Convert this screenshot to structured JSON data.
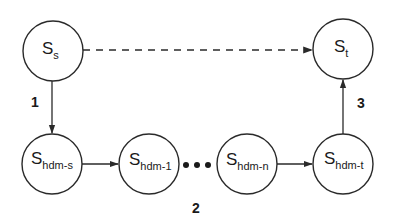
{
  "diagram": {
    "nodes": [
      {
        "id": "s_s",
        "main": "S",
        "sub": "s",
        "cx": 53,
        "cy": 51
      },
      {
        "id": "s_t",
        "main": "S",
        "sub": "t",
        "cx": 343,
        "cy": 49
      },
      {
        "id": "s_hdm_s",
        "main": "S",
        "sub": "hdm-s",
        "cx": 52,
        "cy": 164
      },
      {
        "id": "s_hdm_1",
        "main": "S",
        "sub": "hdm-1",
        "cx": 149,
        "cy": 164
      },
      {
        "id": "s_hdm_n",
        "main": "S",
        "sub": "hdm-n",
        "cx": 247,
        "cy": 164
      },
      {
        "id": "s_hdm_t",
        "main": "S",
        "sub": "hdm-t",
        "cx": 343,
        "cy": 164
      }
    ],
    "edges": [
      {
        "from": "s_s",
        "to": "s_t",
        "style": "dashed"
      },
      {
        "from": "s_s",
        "to": "s_hdm_s",
        "style": "solid",
        "label": "1"
      },
      {
        "from": "s_hdm_s",
        "to": "s_hdm_1",
        "style": "solid"
      },
      {
        "from": "s_hdm_1",
        "to": "s_hdm_n",
        "style": "ellipsis",
        "label": "2"
      },
      {
        "from": "s_hdm_n",
        "to": "s_hdm_t",
        "style": "solid"
      },
      {
        "from": "s_hdm_t",
        "to": "s_t",
        "style": "solid",
        "label": "3"
      }
    ],
    "labels": {
      "edge1": "1",
      "edge2": "2",
      "edge3": "3",
      "ellipsis": "•••"
    },
    "colors": {
      "stroke": "#2a2a2a",
      "background": "#ffffff"
    }
  }
}
